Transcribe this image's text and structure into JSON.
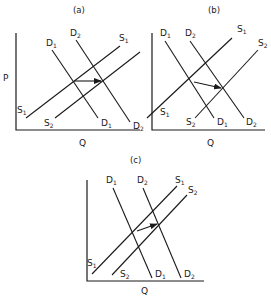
{
  "diagram": {
    "type": "supply-demand-shifts",
    "panels": [
      {
        "id": "a",
        "title": "(a)",
        "y_axis_label": "P",
        "x_axis_label": "Q",
        "curves": [
          {
            "name": "D1",
            "base": "D",
            "sub": "1"
          },
          {
            "name": "D2",
            "base": "D",
            "sub": "2"
          },
          {
            "name": "S1",
            "base": "S",
            "sub": "1"
          },
          {
            "name": "S2",
            "base": "S",
            "sub": "2"
          }
        ],
        "arrow": "horizontal shift of equilibrium from D1/S1 intersection to D2/S2 intersection"
      },
      {
        "id": "b",
        "title": "(b)",
        "x_axis_label": "Q",
        "curves": [
          {
            "name": "D1",
            "base": "D",
            "sub": "1"
          },
          {
            "name": "D2",
            "base": "D",
            "sub": "2"
          },
          {
            "name": "S1",
            "base": "S",
            "sub": "1"
          },
          {
            "name": "S2",
            "base": "S",
            "sub": "2"
          }
        ],
        "arrow": "downward-right shift of equilibrium from D1/S1 intersection to D2/S2 intersection"
      },
      {
        "id": "c",
        "title": "(c)",
        "x_axis_label": "Q",
        "curves": [
          {
            "name": "D1",
            "base": "D",
            "sub": "1"
          },
          {
            "name": "D2",
            "base": "D",
            "sub": "2"
          },
          {
            "name": "S1",
            "base": "S",
            "sub": "1"
          },
          {
            "name": "S2",
            "base": "S",
            "sub": "2"
          }
        ],
        "arrow": "upward-right shift of equilibrium from D1/S1 intersection to D2/S2 intersection"
      }
    ]
  },
  "labels": {
    "a_title": "(a)",
    "b_title": "(b)",
    "c_title": "(c)",
    "p": "P",
    "q": "Q",
    "d": "D",
    "s": "S",
    "one": "1",
    "two": "2"
  }
}
